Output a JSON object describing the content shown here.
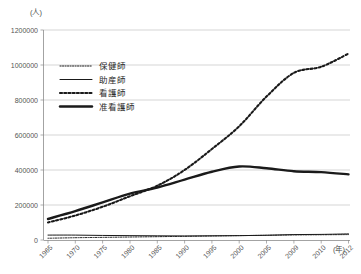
{
  "chart_data": {
    "type": "line",
    "title": "",
    "xlabel": "(年)",
    "ylabel": "(人)",
    "x": [
      1965,
      1970,
      1975,
      1980,
      1985,
      1990,
      1995,
      2000,
      2005,
      2009,
      2010,
      2012
    ],
    "categories": [
      "1965",
      "1970",
      "1975",
      "1980",
      "1985",
      "1990",
      "1995",
      "2000",
      "2005",
      "2009",
      "2010",
      "2012"
    ],
    "xlim": [
      1965,
      2012
    ],
    "ylim": [
      0,
      1200000
    ],
    "ytick_values": [
      0,
      200000,
      400000,
      600000,
      800000,
      1000000,
      1200000
    ],
    "ytick_labels": [
      "0",
      "200000",
      "400000",
      "600000",
      "800000",
      "1000000",
      "1200000"
    ],
    "grid": true,
    "legend_position": "upper-left-inside",
    "series": [
      {
        "name": "保健師",
        "style": "fine-dotted-thin",
        "values": [
          10000,
          13000,
          15000,
          17000,
          19000,
          21000,
          23000,
          25000,
          27000,
          29000,
          30000,
          31000
        ]
      },
      {
        "name": "助産師",
        "style": "solid-thin",
        "values": [
          28000,
          28000,
          26000,
          25000,
          24000,
          23000,
          24000,
          25000,
          27000,
          31000,
          32000,
          35000
        ]
      },
      {
        "name": "看護師",
        "style": "bold-dotted",
        "values": [
          100000,
          140000,
          190000,
          250000,
          310000,
          400000,
          520000,
          650000,
          820000,
          955000,
          990000,
          1065000
        ]
      },
      {
        "name": "准看護師",
        "style": "bold-solid",
        "values": [
          120000,
          165000,
          215000,
          265000,
          300000,
          345000,
          390000,
          420000,
          410000,
          393000,
          388000,
          375000
        ]
      }
    ]
  },
  "axis": {
    "y_unit": "(人)",
    "x_unit": "(年)"
  },
  "legend": {
    "items": [
      {
        "label": "保健師"
      },
      {
        "label": "助産師"
      },
      {
        "label": "看護師"
      },
      {
        "label": "准看護師"
      }
    ]
  }
}
